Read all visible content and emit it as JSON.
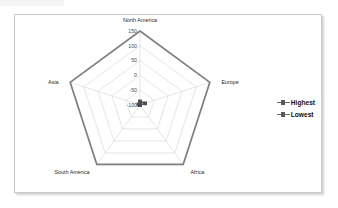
{
  "chart_data": {
    "type": "radar",
    "title": "",
    "categories": [
      "North America",
      "Europe",
      "Africa",
      "South America",
      "Asia"
    ],
    "series": [
      {
        "name": "Highest",
        "values": [
          150,
          148,
          148,
          148,
          148
        ],
        "color": "#808080"
      },
      {
        "name": "Lowest",
        "values": [
          -88,
          -82,
          -100,
          -100,
          -95
        ],
        "color": "#4d4d4d"
      }
    ],
    "tick_labels": [
      "150",
      "100",
      "50",
      "0",
      "-50",
      "-100"
    ],
    "tick_values": [
      150,
      100,
      50,
      0,
      -50,
      -100
    ],
    "rlim": [
      -100,
      150
    ],
    "grid": true,
    "legend_position": "right",
    "legend_entries": [
      "Highest",
      "Lowest"
    ]
  },
  "legend": {
    "items": [
      {
        "label": "Highest",
        "marker": "line-square-marker"
      },
      {
        "label": "Lowest",
        "marker": "line-square-marker"
      }
    ]
  }
}
